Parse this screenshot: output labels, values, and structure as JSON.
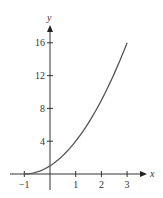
{
  "chart_data": {
    "type": "line",
    "title": "",
    "xlabel": "x",
    "ylabel": "y",
    "xlim": [
      -1,
      3
    ],
    "ylim": [
      0,
      16
    ],
    "grid": false,
    "legend": null,
    "x_ticks": [
      "-1",
      "1",
      "2",
      "3"
    ],
    "y_ticks": [
      "4",
      "8",
      "12",
      "16"
    ],
    "series": [
      {
        "name": "y = (x+1)^2",
        "x": [
          -1,
          -0.5,
          0,
          0.5,
          1,
          1.5,
          2,
          2.5,
          3
        ],
        "values": [
          0,
          0.25,
          1,
          2.25,
          4,
          6.25,
          9,
          12.25,
          16
        ]
      }
    ],
    "colors": {
      "curve": "#555555",
      "axis": "#333333"
    }
  }
}
